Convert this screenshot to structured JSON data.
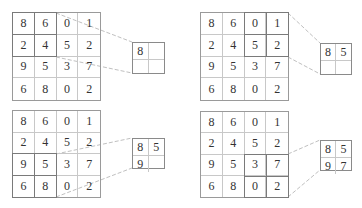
{
  "diagram": {
    "input_matrix": [
      [
        "8",
        "6",
        "0",
        "1"
      ],
      [
        "2",
        "4",
        "5",
        "2"
      ],
      [
        "9",
        "5",
        "3",
        "7"
      ],
      [
        "6",
        "8",
        "0",
        "2"
      ]
    ],
    "panels": [
      {
        "id": "step-1",
        "window": {
          "row": 0,
          "col": 0
        },
        "output": [
          [
            "8",
            ""
          ],
          [
            "",
            ""
          ]
        ]
      },
      {
        "id": "step-2",
        "window": {
          "row": 0,
          "col": 2
        },
        "output": [
          [
            "8",
            "5"
          ],
          [
            "",
            ""
          ]
        ]
      },
      {
        "id": "step-3",
        "window": {
          "row": 2,
          "col": 0
        },
        "output": [
          [
            "8",
            "5"
          ],
          [
            "9",
            ""
          ]
        ]
      },
      {
        "id": "step-4",
        "window": {
          "row": 2,
          "col": 2
        },
        "output": [
          [
            "8",
            "5"
          ],
          [
            "9",
            "7"
          ]
        ]
      }
    ],
    "colors": {
      "grid_border": "#9a9a9a",
      "cell_line": "#c8c8c8",
      "highlight": "#7a7a7a",
      "connector": "#c0c0c0",
      "text": "#333333"
    }
  }
}
